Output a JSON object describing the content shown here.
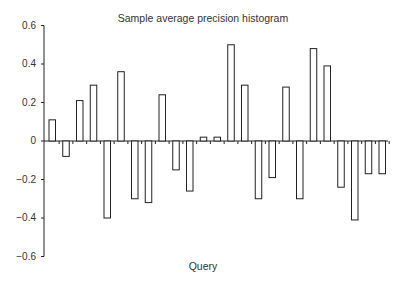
{
  "chart_data": {
    "type": "bar",
    "title": "Sample average precision histogram",
    "xlabel": "Query",
    "ylabel": "",
    "ylim": [
      -0.6,
      0.6
    ],
    "yticks": [
      0.6,
      0.4,
      0.2,
      0,
      -0.2,
      -0.4,
      -0.6
    ],
    "ytick_labels": [
      "0.6",
      "0.4",
      "0.2",
      "0",
      "−0.2",
      "−0.4",
      "−0.6"
    ],
    "categories": [
      "1",
      "2",
      "3",
      "4",
      "5",
      "6",
      "7",
      "8",
      "9",
      "10",
      "11",
      "12",
      "13",
      "14",
      "15",
      "16",
      "17",
      "18",
      "19",
      "20",
      "21",
      "22",
      "23",
      "24",
      "25"
    ],
    "values": [
      0.11,
      -0.08,
      0.21,
      0.29,
      -0.4,
      0.36,
      -0.3,
      -0.32,
      0.24,
      -0.15,
      -0.26,
      0.02,
      0.02,
      0.5,
      0.29,
      -0.3,
      -0.19,
      0.28,
      -0.3,
      0.48,
      0.39,
      -0.24,
      -0.41,
      -0.17,
      -0.17
    ],
    "grid": false,
    "legend": null,
    "bar_fill": "#ffffff",
    "bar_stroke": "#222222"
  }
}
